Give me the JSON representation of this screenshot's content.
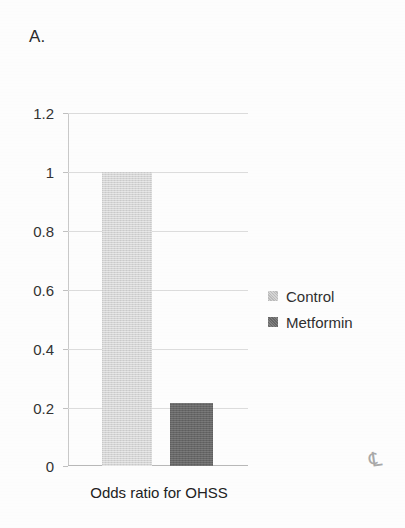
{
  "figure": {
    "panel_label": "A."
  },
  "chart_data": {
    "type": "bar",
    "title": "",
    "subtitle": "",
    "xlabel": "Odds ratio for OHSS",
    "ylabel": "",
    "categories": [
      "Odds ratio for OHSS"
    ],
    "series": [
      {
        "name": "Control",
        "values": [
          1.0
        ],
        "color": "#d4d4d4"
      },
      {
        "name": "Metformin",
        "values": [
          0.215
        ],
        "color": "#666666"
      }
    ],
    "ylim": [
      0,
      1.2
    ],
    "ytick_labels": [
      "1.2",
      "1",
      "0.8",
      "0.6",
      "0.4",
      "0.2",
      "0"
    ],
    "ytick_values": [
      1.2,
      1.0,
      0.8,
      0.6,
      0.4,
      0.2,
      0
    ],
    "grid": true,
    "legend_position": "right",
    "legend": [
      {
        "label": "Control",
        "swatch": "control"
      },
      {
        "label": "Metformin",
        "swatch": "metformin"
      }
    ]
  },
  "artifact": {
    "mark": "℄"
  }
}
